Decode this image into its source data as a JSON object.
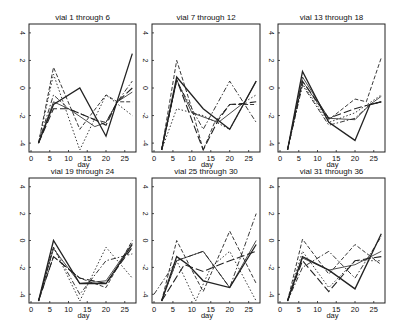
{
  "chart_data": [
    {
      "type": "line",
      "title": "vial 1 through 6",
      "xlabel": "day",
      "ylabel": "",
      "xlim": [
        0,
        28
      ],
      "ylim": [
        -4.5,
        4.5
      ],
      "xticks": [
        0,
        5,
        10,
        15,
        20,
        25
      ],
      "yticks": [
        -4,
        -2,
        0,
        2,
        4
      ],
      "grid": false,
      "series": [
        {
          "name": "vial 1",
          "style": "solid",
          "x": [
            2,
            6,
            13,
            20,
            27
          ],
          "y": [
            -4,
            -1.2,
            0,
            -3.5,
            2.5
          ]
        },
        {
          "name": "vial 2",
          "style": "dashed",
          "x": [
            2,
            6,
            13,
            20,
            23,
            27
          ],
          "y": [
            -4,
            1.5,
            -3,
            -0.5,
            -1,
            -1
          ]
        },
        {
          "name": "vial 3",
          "style": "dotted",
          "x": [
            2,
            6,
            13,
            20,
            27
          ],
          "y": [
            -4,
            1,
            -4.5,
            -0.5,
            -2
          ]
        },
        {
          "name": "vial 4",
          "style": "dashdot",
          "x": [
            2,
            6,
            10,
            17,
            20,
            23,
            27
          ],
          "y": [
            -4,
            -0.5,
            -1.5,
            -2.3,
            -2.5,
            -1,
            0.5
          ]
        },
        {
          "name": "vial 5",
          "style": "longdash",
          "x": [
            2,
            6,
            10,
            17,
            20,
            23,
            27
          ],
          "y": [
            -4,
            -1.5,
            -1.5,
            -2.3,
            -2.7,
            -1,
            0
          ]
        },
        {
          "name": "vial 6",
          "style": "solid-thin",
          "x": [
            2,
            6,
            10,
            17,
            20,
            23,
            27
          ],
          "y": [
            -4,
            -1,
            -1.5,
            -2.8,
            -2.5,
            -1,
            -0.3
          ]
        }
      ]
    },
    {
      "type": "line",
      "title": "vial 7 through 12",
      "xlabel": "day",
      "ylabel": "",
      "xlim": [
        0,
        28
      ],
      "ylim": [
        -4.5,
        4.5
      ],
      "xticks": [
        0,
        5,
        10,
        15,
        20,
        25
      ],
      "yticks": [
        -4,
        -2,
        0,
        2,
        4
      ],
      "grid": false,
      "series": [
        {
          "name": "vial 7",
          "style": "solid",
          "x": [
            2,
            6,
            13,
            20,
            27
          ],
          "y": [
            -4.5,
            0.8,
            -1.5,
            -3,
            0.5
          ]
        },
        {
          "name": "vial 8",
          "style": "dashed",
          "x": [
            2,
            6,
            10,
            13,
            16,
            20,
            27
          ],
          "y": [
            -4.5,
            2,
            -1.5,
            -4.5,
            -2.5,
            -1.2,
            -1.2
          ]
        },
        {
          "name": "vial 9",
          "style": "dotted",
          "x": [
            2,
            6,
            13,
            20,
            24,
            27
          ],
          "y": [
            -4.5,
            -1.5,
            -2,
            -3,
            -1,
            -0.5
          ]
        },
        {
          "name": "vial 10",
          "style": "dashdot",
          "x": [
            2,
            6,
            13,
            20,
            27
          ],
          "y": [
            -4.5,
            0.5,
            -3,
            0.5,
            -2.5
          ]
        },
        {
          "name": "vial 11",
          "style": "longdash",
          "x": [
            2,
            6,
            13,
            17,
            20,
            24,
            27
          ],
          "y": [
            -4.5,
            0.6,
            -4.5,
            -2.3,
            -1.2,
            -1.1,
            -1
          ]
        },
        {
          "name": "vial 12",
          "style": "solid-thin",
          "x": [
            2,
            6,
            10,
            17,
            24,
            27
          ],
          "y": [
            -4.5,
            0.6,
            -1.8,
            -2.5,
            -1,
            0.5
          ]
        }
      ]
    },
    {
      "type": "line",
      "title": "vial 13 through 18",
      "xlabel": "day",
      "ylabel": "",
      "xlim": [
        0,
        28
      ],
      "ylim": [
        -4.5,
        4.5
      ],
      "xticks": [
        0,
        5,
        10,
        15,
        20,
        25
      ],
      "yticks": [
        -4,
        -2,
        0,
        2,
        4
      ],
      "grid": false,
      "series": [
        {
          "name": "vial 13",
          "style": "solid",
          "x": [
            2,
            6,
            13,
            20,
            24,
            27
          ],
          "y": [
            -4.5,
            1.2,
            -2.5,
            -3.8,
            -1.2,
            -1
          ]
        },
        {
          "name": "vial 14",
          "style": "dashed",
          "x": [
            2,
            6,
            13,
            20,
            23,
            27
          ],
          "y": [
            -4.5,
            0.5,
            -2.3,
            -0.8,
            -1,
            2.2
          ]
        },
        {
          "name": "vial 15",
          "style": "dotted",
          "x": [
            2,
            6,
            13,
            20,
            27
          ],
          "y": [
            -4.5,
            0.3,
            -2.5,
            -1.8,
            -0.5
          ]
        },
        {
          "name": "vial 16",
          "style": "dashdot",
          "x": [
            2,
            6,
            13,
            20,
            24,
            27
          ],
          "y": [
            -4.5,
            0.2,
            -2.7,
            -2.2,
            -1.2,
            -1
          ]
        },
        {
          "name": "vial 17",
          "style": "longdash",
          "x": [
            2,
            6,
            13,
            20,
            24,
            27
          ],
          "y": [
            -4.5,
            0.5,
            -2.2,
            -1.5,
            -1.2,
            -1
          ]
        },
        {
          "name": "vial 18",
          "style": "solid-thin",
          "x": [
            2,
            6,
            13,
            20,
            24,
            27
          ],
          "y": [
            -4.5,
            0.8,
            -2.2,
            -2.3,
            -1.2,
            -0.6
          ]
        }
      ]
    },
    {
      "type": "line",
      "title": "vial 19 through 24",
      "xlabel": "day",
      "ylabel": "",
      "xlim": [
        0,
        28
      ],
      "ylim": [
        -4.5,
        4.5
      ],
      "xticks": [
        0,
        5,
        10,
        15,
        20,
        25
      ],
      "yticks": [
        -4,
        -2,
        0,
        2,
        4
      ],
      "grid": false,
      "series": [
        {
          "name": "vial 19",
          "style": "solid",
          "x": [
            2,
            6,
            13,
            20,
            27
          ],
          "y": [
            -4.5,
            0,
            -3.2,
            -3.2,
            -0.3
          ]
        },
        {
          "name": "vial 20",
          "style": "dashed",
          "x": [
            2,
            6,
            13,
            20,
            27
          ],
          "y": [
            -4.5,
            -1.2,
            -2.8,
            -3.5,
            0
          ]
        },
        {
          "name": "vial 21",
          "style": "dotted",
          "x": [
            2,
            6,
            13,
            20,
            27
          ],
          "y": [
            -4.5,
            -0.5,
            -4.5,
            -0.5,
            -2.8
          ]
        },
        {
          "name": "vial 22",
          "style": "dashdot",
          "x": [
            2,
            6,
            13,
            20,
            27
          ],
          "y": [
            -4.5,
            -0.5,
            -4,
            -1.5,
            -1
          ]
        },
        {
          "name": "vial 23",
          "style": "longdash",
          "x": [
            2,
            6,
            13,
            20,
            27
          ],
          "y": [
            -4.5,
            -1.2,
            -2.8,
            -3.2,
            -0.5
          ]
        },
        {
          "name": "vial 24",
          "style": "solid-thin",
          "x": [
            2,
            6,
            13,
            20,
            27
          ],
          "y": [
            -4.5,
            -0.6,
            -3.2,
            -3,
            -0.2
          ]
        }
      ]
    },
    {
      "type": "line",
      "title": "vial 25 through 30",
      "xlabel": "day",
      "ylabel": "",
      "xlim": [
        0,
        28
      ],
      "ylim": [
        -4.5,
        4.5
      ],
      "xticks": [
        0,
        5,
        10,
        15,
        20,
        25
      ],
      "yticks": [
        -4,
        -2,
        0,
        2,
        4
      ],
      "grid": false,
      "series": [
        {
          "name": "vial 25",
          "style": "solid",
          "x": [
            2,
            6,
            9,
            13,
            20,
            27
          ],
          "y": [
            -4.5,
            -1.2,
            -1.8,
            -3,
            -3.5,
            -0.3
          ]
        },
        {
          "name": "vial 26",
          "style": "dashed",
          "x": [
            2,
            6,
            10,
            13,
            20,
            27
          ],
          "y": [
            -4.5,
            0,
            -2.2,
            -3.8,
            0.7,
            -3.2
          ]
        },
        {
          "name": "vial 27",
          "style": "dotted",
          "x": [
            2,
            6,
            11,
            15,
            20,
            27
          ],
          "y": [
            -4.5,
            -1.5,
            -4.5,
            -2,
            -0.8,
            -4.5
          ]
        },
        {
          "name": "vial 28",
          "style": "dashdot",
          "x": [
            0,
            6,
            13,
            20,
            27
          ],
          "y": [
            -4,
            -1.5,
            -0.8,
            -3.5,
            2
          ]
        },
        {
          "name": "vial 29",
          "style": "longdash",
          "x": [
            2,
            8,
            13,
            20,
            27
          ],
          "y": [
            -4.5,
            -1.8,
            -2.3,
            -1.5,
            -0.8
          ]
        },
        {
          "name": "vial 30",
          "style": "solid-thin",
          "x": [
            2,
            6,
            13,
            20,
            27
          ],
          "y": [
            -4.5,
            -1.5,
            -0.8,
            -3.5,
            0
          ]
        }
      ]
    },
    {
      "type": "line",
      "title": "vial 31 through 36",
      "xlabel": "day",
      "ylabel": "",
      "xlim": [
        0,
        28
      ],
      "ylim": [
        -4.5,
        4.5
      ],
      "xticks": [
        0,
        5,
        10,
        15,
        20,
        25
      ],
      "yticks": [
        -4,
        -2,
        0,
        2,
        4
      ],
      "grid": false,
      "series": [
        {
          "name": "vial 31",
          "style": "solid",
          "x": [
            2,
            6,
            13,
            20,
            27
          ],
          "y": [
            -4.5,
            -1.2,
            -2.2,
            -3.6,
            0.5
          ]
        },
        {
          "name": "vial 32",
          "style": "dashed",
          "x": [
            2,
            6,
            13,
            20,
            27
          ],
          "y": [
            -4.5,
            0.1,
            -2.5,
            -0.3,
            -1.8
          ]
        },
        {
          "name": "vial 33",
          "style": "dotted",
          "x": [
            2,
            6,
            13,
            20,
            27
          ],
          "y": [
            -4.5,
            -0.8,
            -3.5,
            -1.5,
            -1.5
          ]
        },
        {
          "name": "vial 34",
          "style": "dashdot",
          "x": [
            2,
            6,
            13,
            20,
            27
          ],
          "y": [
            -4.5,
            -2,
            -0.8,
            -2.8,
            0.3
          ]
        },
        {
          "name": "vial 35",
          "style": "longdash",
          "x": [
            2,
            6,
            13,
            20,
            27
          ],
          "y": [
            -4.5,
            -1.5,
            -3.8,
            -1.5,
            -1.2
          ]
        },
        {
          "name": "vial 36",
          "style": "solid-thin",
          "x": [
            2,
            6,
            13,
            20,
            27
          ],
          "y": [
            -4.5,
            -1.3,
            -2.2,
            -1.8,
            -0.8
          ]
        }
      ]
    }
  ]
}
